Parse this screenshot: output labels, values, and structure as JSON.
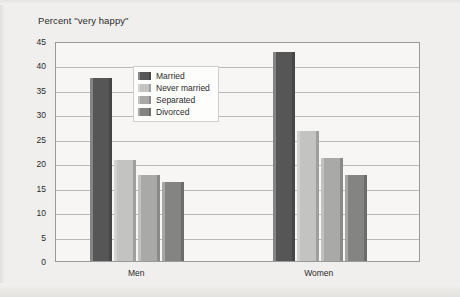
{
  "chart_data": {
    "type": "bar",
    "title": "Percent \"very happy\"",
    "xlabel": "",
    "ylabel": "",
    "categories": [
      "Men",
      "Women"
    ],
    "series": [
      {
        "name": "Married",
        "values": [
          37.4,
          42.8
        ],
        "color": "#565656"
      },
      {
        "name": "Never married",
        "values": [
          20.7,
          26.5
        ],
        "color": "#c3c3c1"
      },
      {
        "name": "Separated",
        "values": [
          17.6,
          21.0
        ],
        "color": "#a9a9a7"
      },
      {
        "name": "Divorced",
        "values": [
          16.2,
          17.5
        ],
        "color": "#848482"
      }
    ],
    "ylim": [
      0,
      45
    ],
    "yticks": [
      0,
      5,
      10,
      15,
      20,
      25,
      30,
      35,
      40,
      45
    ],
    "ytick_labels": [
      "0",
      "5",
      "10",
      "15",
      "20",
      "25",
      "30",
      "35",
      "40",
      "45"
    ],
    "grid": "horizontal",
    "legend_position": "inside-top-left"
  },
  "legend": {
    "items": [
      {
        "label": "Married"
      },
      {
        "label": "Never married"
      },
      {
        "label": "Separated"
      },
      {
        "label": "Divorced"
      }
    ]
  }
}
